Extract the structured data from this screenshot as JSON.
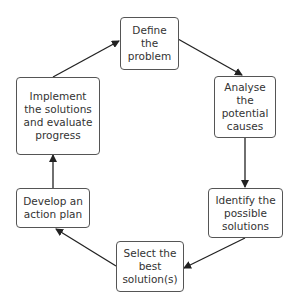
{
  "diagram": {
    "type": "cycle",
    "nodes": [
      {
        "id": "define",
        "label": "Define the problem"
      },
      {
        "id": "analyse",
        "label": "Analyse the potential causes"
      },
      {
        "id": "identify",
        "label": "Identify the possible solutions"
      },
      {
        "id": "select",
        "label": "Select the best solution(s)"
      },
      {
        "id": "develop",
        "label": "Develop an action plan"
      },
      {
        "id": "implement",
        "label": "Implement the solutions and evaluate progress"
      }
    ],
    "edges": [
      {
        "from": "define",
        "to": "analyse"
      },
      {
        "from": "analyse",
        "to": "identify"
      },
      {
        "from": "identify",
        "to": "select"
      },
      {
        "from": "select",
        "to": "develop"
      },
      {
        "from": "develop",
        "to": "implement"
      },
      {
        "from": "implement",
        "to": "define"
      }
    ],
    "colors": {
      "stroke": "#222222",
      "box_border": "#555555",
      "text": "#333333"
    }
  }
}
